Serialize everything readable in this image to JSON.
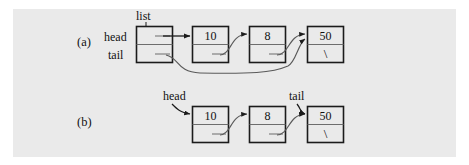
{
  "figure": {
    "kind": "linked-list-diagram",
    "background_color": "#eaeaea",
    "page_color": "#ffffff",
    "ink_color": "#111111",
    "box_fill": "#eaeaea"
  },
  "panels": [
    {
      "id": "a",
      "label": "(a)",
      "header_label": "list",
      "pointer_labels": [
        {
          "name": "head",
          "text": "head"
        },
        {
          "name": "tail",
          "text": "tail"
        }
      ],
      "nodes": [
        {
          "value": "10",
          "next": "8"
        },
        {
          "value": "8",
          "next": "50"
        },
        {
          "value": "50",
          "next": "\\"
        }
      ]
    },
    {
      "id": "b",
      "label": "(b)",
      "pointer_labels": [
        {
          "name": "head",
          "text": "head"
        },
        {
          "name": "tail",
          "text": "tail"
        }
      ],
      "nodes": [
        {
          "value": "10",
          "next": "8"
        },
        {
          "value": "8",
          "next": "50"
        },
        {
          "value": "50",
          "next": "\\"
        }
      ]
    }
  ]
}
